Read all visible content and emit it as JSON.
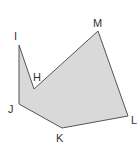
{
  "figure": {
    "type": "polygon",
    "shape_name": "hexagon HMLKJI",
    "fill_color": "#d9d9d9",
    "stroke_color": "#555555",
    "vertices": [
      {
        "label": "I"
      },
      {
        "label": "H"
      },
      {
        "label": "M"
      },
      {
        "label": "L"
      },
      {
        "label": "K"
      },
      {
        "label": "J"
      }
    ]
  }
}
